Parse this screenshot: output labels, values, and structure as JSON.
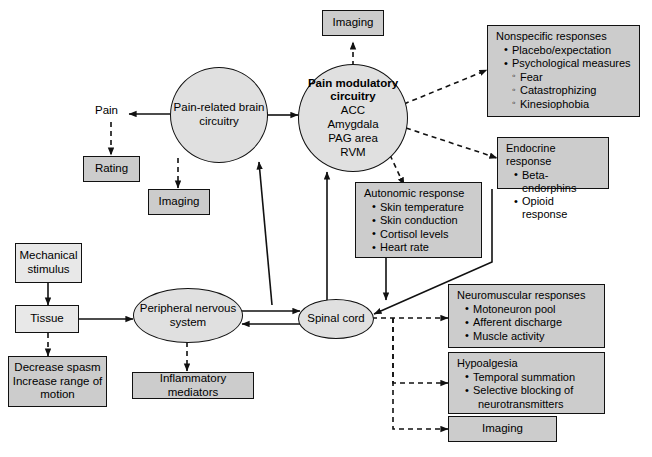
{
  "diagram": {
    "colors": {
      "box_fill": "#cccccc",
      "ellipse_fill": "#e0e0e0",
      "stroke": "#111111",
      "background": "#ffffff"
    },
    "labels": {
      "pain": "Pain"
    },
    "nodes": {
      "imaging_top": {
        "label": "Imaging"
      },
      "brain_circuitry": {
        "line1": "Pain-related brain",
        "line2": "circuitry"
      },
      "pain_modulatory": {
        "line1": "Pain modulatory",
        "line2": "circuitry",
        "line3": "ACC",
        "line4": "Amygdala",
        "line5": "PAG area",
        "line6": "RVM"
      },
      "rating": {
        "label": "Rating"
      },
      "imaging_left": {
        "label": "Imaging"
      },
      "nonspecific_responses": {
        "header": "Nonspecific responses",
        "items": [
          {
            "level": 1,
            "text": "Placebo/expectation"
          },
          {
            "level": 1,
            "text": "Psychological measures"
          },
          {
            "level": 2,
            "text": "Fear"
          },
          {
            "level": 2,
            "text": "Catastrophizing"
          },
          {
            "level": 2,
            "text": "Kinesiophobia"
          }
        ]
      },
      "endocrine_response": {
        "header": "Endocrine response",
        "items": [
          {
            "level": 1,
            "text": "Beta-endorphins"
          },
          {
            "level": 1,
            "text": "Opioid response"
          }
        ]
      },
      "autonomic_response": {
        "header": "Autonomic response",
        "items": [
          {
            "level": 1,
            "text": "Skin temperature"
          },
          {
            "level": 1,
            "text": "Skin conduction"
          },
          {
            "level": 1,
            "text": "Cortisol levels"
          },
          {
            "level": 1,
            "text": "Heart rate"
          }
        ]
      },
      "mechanical_stimulus": {
        "line1": "Mechanical",
        "line2": "stimulus"
      },
      "tissue": {
        "label": "Tissue"
      },
      "decrease_spasm": {
        "line1": "Decrease spasm",
        "line2": "Increase range of",
        "line3": "motion"
      },
      "peripheral_nervous_system": {
        "line1": "Peripheral nervous",
        "line2": "system"
      },
      "inflammatory_mediators": {
        "label": "Inflammatory mediators"
      },
      "spinal_cord": {
        "label": "Spinal cord"
      },
      "neuromuscular_responses": {
        "header": "Neuromuscular responses",
        "items": [
          {
            "level": 1,
            "text": "Motoneuron pool"
          },
          {
            "level": 1,
            "text": "Afferent discharge"
          },
          {
            "level": 1,
            "text": "Muscle activity"
          }
        ]
      },
      "hypoalgesia": {
        "header": "Hypoalgesia",
        "items": [
          {
            "level": 1,
            "text": "Temporal summation"
          },
          {
            "level": 1,
            "text": "Selective blocking of"
          },
          {
            "level": 1,
            "text": "neurotransmitters",
            "continuation": true
          }
        ]
      },
      "imaging_bottom": {
        "label": "Imaging"
      }
    }
  }
}
